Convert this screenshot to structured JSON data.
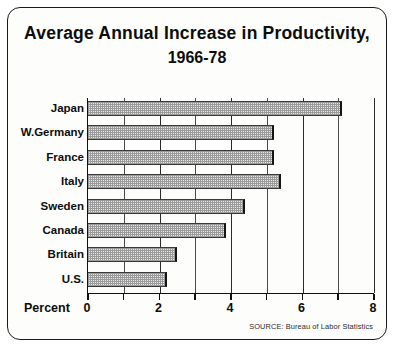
{
  "chart_data": {
    "type": "bar",
    "orientation": "horizontal",
    "title": "Average Annual Increase in Productivity, 1966-78",
    "title_lines": [
      "Average Annual Increase in Productivity,",
      "1966-78"
    ],
    "categories": [
      "Japan",
      "W.Germany",
      "France",
      "Italy",
      "Sweden",
      "Canada",
      "Britain",
      "U.S."
    ],
    "values": [
      7.1,
      5.2,
      5.2,
      5.4,
      4.4,
      3.85,
      2.5,
      2.2
    ],
    "xlabel": "Percent",
    "ylabel": "",
    "xlim": [
      0,
      8
    ],
    "xticks": [
      0,
      1,
      2,
      3,
      4,
      5,
      6,
      7,
      8
    ],
    "xtick_labels": [
      "0",
      "",
      "2",
      "",
      "4",
      "",
      "6",
      "",
      "8"
    ],
    "major_ticks": [
      0,
      2,
      4,
      6,
      8
    ],
    "grid": true,
    "legend": null,
    "annotations": [
      "SOURCE: Bureau of Labor Statistics"
    ],
    "source": "SOURCE: Bureau of Labor Statistics",
    "colors": {
      "bar_fill": "#e8e8e6",
      "bar_pattern": "#9a9a9a",
      "bar_edge": "#151515",
      "axis": "#111111",
      "background": "#fdfdfb",
      "text": "#0d0d0d"
    }
  }
}
